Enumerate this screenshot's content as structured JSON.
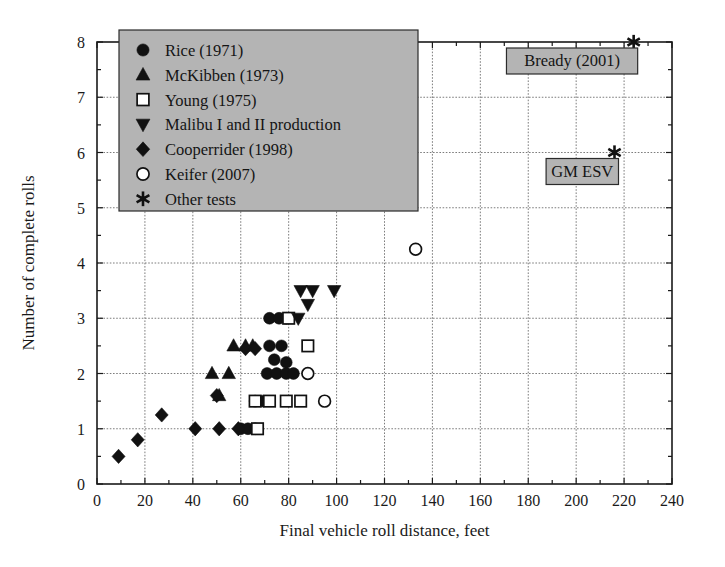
{
  "chart_data": {
    "type": "scatter",
    "title": "",
    "xlabel": "Final vehicle roll distance, feet",
    "ylabel": "Number of complete rolls",
    "xlim": [
      0,
      240
    ],
    "ylim": [
      0,
      8
    ],
    "xticks": [
      0,
      20,
      40,
      60,
      80,
      100,
      120,
      140,
      160,
      180,
      200,
      220,
      240
    ],
    "yticks": [
      0,
      1,
      2,
      3,
      4,
      5,
      6,
      7,
      8
    ],
    "grid": true,
    "legend_position": "upper-left",
    "series": [
      {
        "name": "Rice (1971)",
        "marker": "filled-circle",
        "color": "#111111",
        "points": [
          [
            72,
            3.0
          ],
          [
            76,
            3.0
          ],
          [
            79,
            3.0
          ],
          [
            72,
            2.5
          ],
          [
            77,
            2.5
          ],
          [
            74,
            2.25
          ],
          [
            79,
            2.2
          ],
          [
            71,
            2.0
          ],
          [
            75,
            2.0
          ],
          [
            79,
            2.0
          ],
          [
            82,
            2.0
          ],
          [
            66,
            1.5
          ],
          [
            69,
            1.5
          ],
          [
            60,
            1.0
          ],
          [
            63,
            1.0
          ],
          [
            66,
            1.0
          ]
        ]
      },
      {
        "name": "McKibben (1973)",
        "marker": "filled-triangle-up",
        "color": "#111111",
        "points": [
          [
            48,
            2.0
          ],
          [
            55,
            2.0
          ],
          [
            57,
            2.5
          ],
          [
            62,
            2.5
          ],
          [
            65,
            2.5
          ],
          [
            51,
            1.6
          ]
        ]
      },
      {
        "name": "Young (1975)",
        "marker": "open-square",
        "color": "#111111",
        "points": [
          [
            80,
            3.0
          ],
          [
            88,
            2.5
          ],
          [
            66,
            1.5
          ],
          [
            72,
            1.5
          ],
          [
            79,
            1.5
          ],
          [
            85,
            1.5
          ],
          [
            67,
            1.0
          ]
        ]
      },
      {
        "name": "Malibu I and II production",
        "marker": "filled-triangle-down",
        "color": "#111111",
        "points": [
          [
            85,
            3.5
          ],
          [
            90,
            3.5
          ],
          [
            99,
            3.5
          ],
          [
            88,
            3.25
          ],
          [
            84,
            3.0
          ]
        ]
      },
      {
        "name": "Cooperrider (1998)",
        "marker": "filled-diamond",
        "color": "#111111",
        "points": [
          [
            9,
            0.5
          ],
          [
            17,
            0.8
          ],
          [
            27,
            1.25
          ],
          [
            41,
            1.0
          ],
          [
            51,
            1.0
          ],
          [
            59,
            1.0
          ],
          [
            50,
            1.6
          ],
          [
            62,
            2.45
          ],
          [
            66,
            2.45
          ]
        ]
      },
      {
        "name": "Keifer (2007)",
        "marker": "open-circle",
        "color": "#111111",
        "points": [
          [
            133,
            4.25
          ],
          [
            88,
            2.0
          ],
          [
            95,
            1.5
          ]
        ]
      },
      {
        "name": "Other tests",
        "marker": "asterisk",
        "color": "#111111",
        "points": [
          [
            224,
            8.0
          ],
          [
            216,
            6.0
          ]
        ]
      }
    ],
    "annotations": [
      {
        "label": "Bready (2001)",
        "x": 224,
        "y": 8.0
      },
      {
        "label": "GM ESV",
        "x": 216,
        "y": 6.0
      }
    ]
  },
  "legend": {
    "items": [
      {
        "label": "Rice (1971)",
        "marker": "filled-circle"
      },
      {
        "label": "McKibben (1973)",
        "marker": "filled-triangle-up"
      },
      {
        "label": "Young (1975)",
        "marker": "open-square"
      },
      {
        "label": "Malibu I and II production",
        "marker": "filled-triangle-down"
      },
      {
        "label": "Cooperrider (1998)",
        "marker": "filled-diamond"
      },
      {
        "label": "Keifer (2007)",
        "marker": "open-circle"
      },
      {
        "label": "Other tests",
        "marker": "asterisk"
      }
    ]
  },
  "colors": {
    "marker": "#111111",
    "legend_background": "#b4b4b4",
    "grid": "#6e6e6e",
    "axis": "#1a1a1a"
  }
}
